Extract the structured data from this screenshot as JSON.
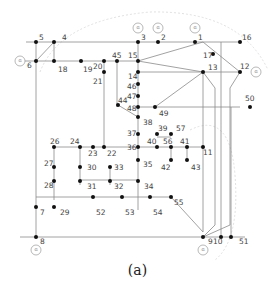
{
  "caption": "(a)",
  "diagram": {
    "bus_labels": [
      "1",
      "2",
      "3",
      "4",
      "5",
      "6",
      "7",
      "8",
      "9",
      "10",
      "11",
      "12",
      "13",
      "14",
      "15",
      "16",
      "17",
      "18",
      "19",
      "20",
      "21",
      "22",
      "23",
      "24",
      "26",
      "27",
      "28",
      "29",
      "30",
      "31",
      "32",
      "33",
      "34",
      "35",
      "36",
      "37",
      "38",
      "39",
      "40",
      "41",
      "42",
      "43",
      "44",
      "45",
      "46",
      "47",
      "48",
      "49",
      "50",
      "51",
      "52",
      "53",
      "54",
      "55",
      "56",
      "57"
    ],
    "generator_buses": [
      "1",
      "2",
      "3",
      "6",
      "8",
      "9",
      "12"
    ],
    "generator_symbol": "G",
    "colors": {
      "line": "#8a8a8a",
      "node": "#111111",
      "dashed_region": "#d8d8d8"
    }
  }
}
